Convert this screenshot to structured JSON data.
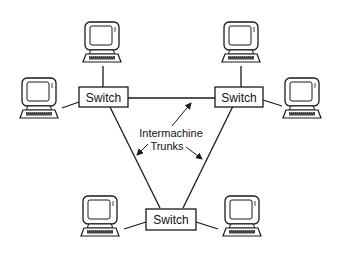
{
  "diagram": {
    "switches": [
      {
        "id": "left",
        "label": "Switch"
      },
      {
        "id": "right",
        "label": "Switch"
      },
      {
        "id": "bottom",
        "label": "Switch"
      }
    ],
    "annotation": {
      "line1": "Intermachine",
      "line2": "Trunks"
    },
    "colors": {
      "line": "#1a1a1a",
      "background": "#ffffff"
    }
  }
}
